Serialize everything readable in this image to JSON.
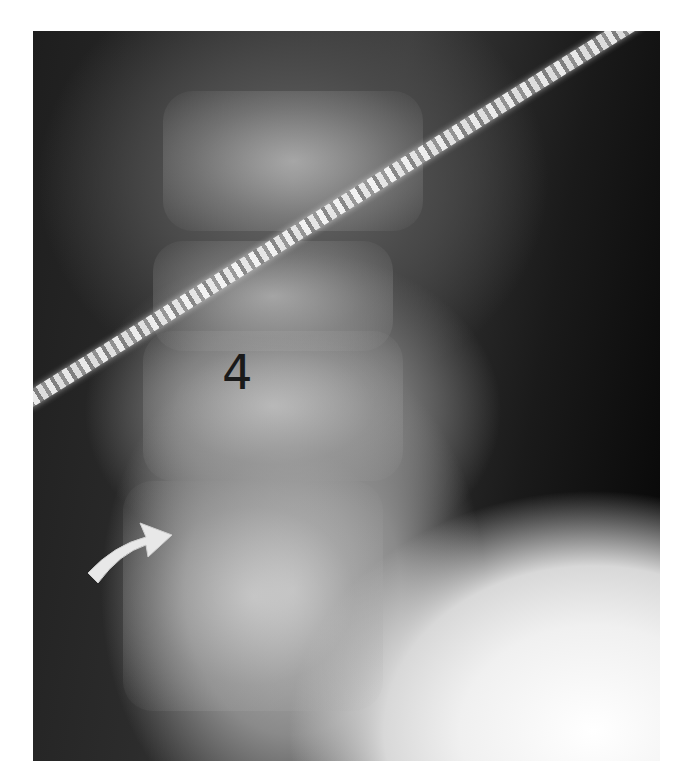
{
  "image": {
    "type": "lateral cervical spine radiograph",
    "annotations": {
      "vertebra_label": "4",
      "arrow": "curved-arrow"
    },
    "colors": {
      "background": "#ffffff",
      "label": "#1a1a1a",
      "arrow": "#e8e8e8"
    }
  }
}
